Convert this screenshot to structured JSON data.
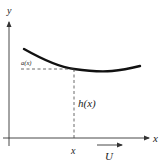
{
  "diagram": {
    "axes": {
      "y_label": "y",
      "x_label": "x"
    },
    "labels": {
      "curve_point": "a(x)",
      "height": "h(x)",
      "x_tick": "x",
      "flow": "U"
    },
    "colors": {
      "stroke": "#111111",
      "axis": "#333333",
      "dashed": "#444444",
      "text": "#222222",
      "background": "#ffffff"
    }
  }
}
